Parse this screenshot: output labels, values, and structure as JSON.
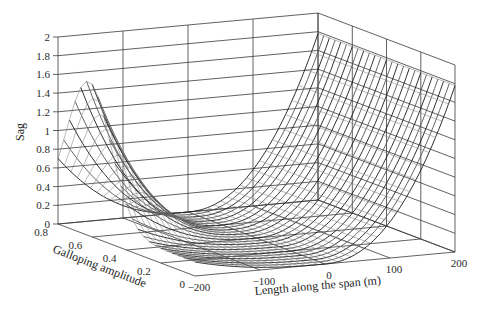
{
  "chart_data": {
    "type": "surface3d",
    "title": "",
    "xlabel": "Length along the span (m)",
    "ylabel": "Galloping amplitude",
    "zlabel": "Sag",
    "x_ticks": [
      -200,
      -100,
      0,
      100,
      200
    ],
    "y_ticks": [
      0,
      0.2,
      0.4,
      0.6,
      0.8
    ],
    "z_ticks": [
      0,
      0.2,
      0.4,
      0.6,
      0.8,
      1,
      1.2,
      1.4,
      1.6,
      1.8,
      2
    ],
    "x_tick_labels": [
      "−200",
      "−100",
      "0",
      "100",
      "200"
    ],
    "y_tick_labels": [
      "0",
      "0.2",
      "0.4",
      "0.6",
      "0.8"
    ],
    "z_tick_labels": [
      "0",
      "0.2",
      "0.4",
      "0.6",
      "0.8",
      "1",
      "1.2",
      "1.4",
      "1.6",
      "1.8",
      "2"
    ],
    "xlim": [
      -200,
      200
    ],
    "ylim": [
      0,
      0.8
    ],
    "zlim": [
      0,
      2
    ],
    "grid": true,
    "surface": {
      "description": "Mesh surface of cable sag vs span length and galloping amplitude; minimum near length 0 (sag ~0), rising to ~1.8 at length 200 and ~1.5 peak at length -200 near amplitude ~0.6",
      "rows": 24,
      "sag_at_x_minus_200_peak": 1.5,
      "sag_at_x_200": 1.78,
      "sag_min": 0
    },
    "line_color": "#1a1a1a"
  }
}
